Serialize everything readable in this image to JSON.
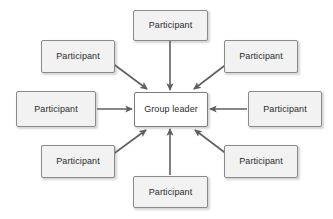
{
  "diagram": {
    "canvas": {
      "width": 333,
      "height": 219,
      "background": "#ffffff"
    },
    "style": {
      "node_fill": "#f2f2f2",
      "center_fill": "#ffffff",
      "node_border": "#8a8a8a",
      "edge_color": "#5f5f5f",
      "text_color": "#2b2b2b"
    },
    "center_node": {
      "id": "group-leader",
      "label": "Group leader",
      "x": 134,
      "y": 92,
      "width": 74,
      "height": 35
    },
    "participants": [
      {
        "id": "participant-top",
        "label": "Participant",
        "x": 133,
        "y": 10,
        "width": 75,
        "height": 31
      },
      {
        "id": "participant-top-left",
        "label": "Participant",
        "x": 41,
        "y": 40,
        "width": 74,
        "height": 33
      },
      {
        "id": "participant-top-right",
        "label": "Participant",
        "x": 224,
        "y": 40,
        "width": 74,
        "height": 33
      },
      {
        "id": "participant-left",
        "label": "Participant",
        "x": 16,
        "y": 91,
        "width": 80,
        "height": 36
      },
      {
        "id": "participant-right",
        "label": "Participant",
        "x": 248,
        "y": 91,
        "width": 74,
        "height": 36
      },
      {
        "id": "participant-bottom-left",
        "label": "Participant",
        "x": 41,
        "y": 145,
        "width": 74,
        "height": 33
      },
      {
        "id": "participant-bottom-right",
        "label": "Participant",
        "x": 224,
        "y": 145,
        "width": 74,
        "height": 33
      },
      {
        "id": "participant-bottom",
        "label": "Participant",
        "x": 133,
        "y": 176,
        "width": 75,
        "height": 32
      }
    ],
    "edges": [
      {
        "id": "edge-top-to-center",
        "from": "participant-top",
        "to": "group-leader",
        "x1": 170,
        "y1": 41,
        "x2": 170,
        "y2": 90
      },
      {
        "id": "edge-top-left-to-center",
        "from": "participant-top-left",
        "to": "group-leader",
        "x1": 112,
        "y1": 63,
        "x2": 147,
        "y2": 89
      },
      {
        "id": "edge-top-right-to-center",
        "from": "participant-top-right",
        "to": "group-leader",
        "x1": 228,
        "y1": 63,
        "x2": 194,
        "y2": 89
      },
      {
        "id": "edge-left-to-center",
        "from": "participant-left",
        "to": "group-leader",
        "x1": 97,
        "y1": 109,
        "x2": 132,
        "y2": 109
      },
      {
        "id": "edge-right-to-center",
        "from": "participant-right",
        "to": "group-leader",
        "x1": 247,
        "y1": 109,
        "x2": 210,
        "y2": 109
      },
      {
        "id": "edge-bottom-to-center",
        "from": "participant-bottom",
        "to": "group-leader",
        "x1": 170,
        "y1": 175,
        "x2": 170,
        "y2": 129
      },
      {
        "id": "edge-bottom-left-to-center",
        "from": "participant-bottom-left",
        "to": "group-leader",
        "x1": 112,
        "y1": 155,
        "x2": 146,
        "y2": 130
      },
      {
        "id": "edge-bottom-right-to-center",
        "from": "participant-bottom-right",
        "to": "group-leader",
        "x1": 228,
        "y1": 155,
        "x2": 195,
        "y2": 130
      }
    ]
  }
}
